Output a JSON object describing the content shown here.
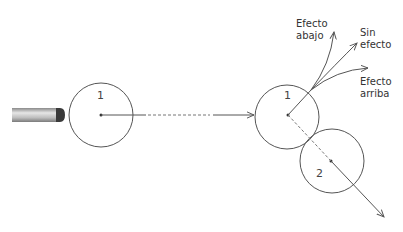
{
  "diagram": {
    "balls": [
      {
        "id": "ball-1-initial",
        "label": "1"
      },
      {
        "id": "ball-1-impact",
        "label": "1"
      },
      {
        "id": "ball-2-impact",
        "label": "2"
      }
    ],
    "spin_paths": {
      "down": {
        "label_line1": "Efecto",
        "label_line2": "abajo"
      },
      "none": {
        "label_line1": "Sin",
        "label_line2": "efecto"
      },
      "up": {
        "label_line1": "Efecto",
        "label_line2": "arriba"
      }
    },
    "colors": {
      "line": "#555555",
      "text": "#333333",
      "cue_body": "#c9c9c9",
      "cue_tip": "#3a3a3a"
    }
  }
}
